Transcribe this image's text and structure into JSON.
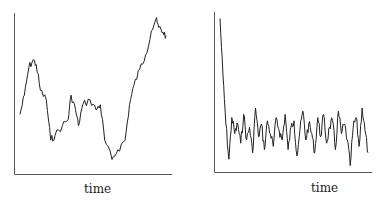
{
  "chart_data": [
    {
      "type": "line",
      "title": "",
      "xlabel": "time",
      "ylabel": "",
      "ylim": [
        0,
        100
      ],
      "grid": false,
      "legend": null,
      "description": "Random-walk-like non-stationary series (unlabeled axes; values on relative 0-100 scale)",
      "x": [
        0,
        3,
        6,
        9,
        11,
        14,
        18,
        21,
        24,
        29,
        33,
        35,
        38,
        40,
        43,
        48,
        52,
        55,
        58,
        63,
        67,
        72,
        75,
        78,
        82,
        86,
        90,
        93,
        95,
        98,
        100
      ],
      "series": [
        {
          "name": "series",
          "values": [
            37,
            49,
            66,
            71,
            68,
            52,
            46,
            21,
            24,
            30,
            34,
            49,
            40,
            30,
            43,
            46,
            40,
            43,
            21,
            9,
            15,
            21,
            43,
            55,
            65,
            74,
            89,
            96,
            91,
            88,
            86
          ]
        }
      ]
    },
    {
      "type": "line",
      "title": "",
      "xlabel": "time",
      "ylabel": "",
      "ylim": [
        0,
        100
      ],
      "grid": false,
      "legend": null,
      "description": "Series with initial transient decaying quickly to a stationary noisy level (unlabeled axes; values on relative 0-100 scale)",
      "x": [
        0,
        2,
        4,
        6,
        8,
        10,
        12,
        14,
        16,
        18,
        20,
        22,
        24,
        26,
        28,
        30,
        32,
        34,
        36,
        38,
        40,
        42,
        44,
        46,
        48,
        50,
        52,
        54,
        56,
        58,
        60,
        62,
        64,
        66,
        68,
        70,
        72,
        74,
        76,
        78,
        80,
        82,
        84,
        86,
        88,
        90,
        92,
        94,
        96,
        98,
        100
      ],
      "series": [
        {
          "name": "series",
          "values": [
            96,
            60,
            30,
            8,
            34,
            24,
            30,
            18,
            36,
            20,
            28,
            12,
            40,
            22,
            30,
            14,
            32,
            24,
            16,
            34,
            26,
            20,
            36,
            14,
            28,
            32,
            10,
            26,
            38,
            20,
            30,
            24,
            12,
            34,
            22,
            36,
            18,
            28,
            32,
            14,
            38,
            24,
            30,
            20,
            4,
            28,
            34,
            16,
            40,
            26,
            12
          ]
        }
      ]
    }
  ],
  "panels": {
    "left": {
      "xlabel": "time"
    },
    "right": {
      "xlabel": "time"
    }
  }
}
